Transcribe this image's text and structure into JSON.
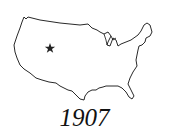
{
  "figure": {
    "marker": {
      "icon": "star-icon",
      "region": "western United States"
    },
    "year_label": "1907"
  }
}
